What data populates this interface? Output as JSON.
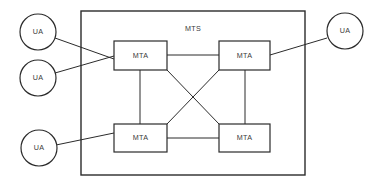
{
  "diagram": {
    "stroke_color": "#2b2b2b",
    "text_color": "#3a3a3a",
    "background_color": "#ffffff",
    "boundary": {
      "label": "MTS",
      "label_x": 193,
      "label_y": 29,
      "x": 81,
      "y": 11,
      "width": 224,
      "height": 164
    },
    "nodes": [
      {
        "id": "ua-left-top",
        "label": "UA",
        "shape": "circle",
        "cx": 38,
        "cy": 32,
        "r": 18
      },
      {
        "id": "ua-left-middle",
        "label": "UA",
        "shape": "circle",
        "cx": 38,
        "cy": 78,
        "r": 18
      },
      {
        "id": "ua-left-bottom",
        "label": "UA",
        "shape": "circle",
        "cx": 39,
        "cy": 148,
        "r": 18
      },
      {
        "id": "ua-right-top",
        "label": "UA",
        "shape": "circle",
        "cx": 345,
        "cy": 31,
        "r": 18
      },
      {
        "id": "mta-top-left",
        "label": "MTA",
        "shape": "rect",
        "x": 114,
        "y": 41,
        "width": 53,
        "height": 29
      },
      {
        "id": "mta-top-right",
        "label": "MTA",
        "shape": "rect",
        "x": 219,
        "y": 41,
        "width": 51,
        "height": 29
      },
      {
        "id": "mta-bottom-left",
        "label": "MTA",
        "shape": "rect",
        "x": 114,
        "y": 124,
        "width": 53,
        "height": 28
      },
      {
        "id": "mta-bottom-right",
        "label": "MTA",
        "shape": "rect",
        "x": 219,
        "y": 124,
        "width": 51,
        "height": 28
      }
    ],
    "edges": [
      {
        "id": "edge-ua-left-top-to-mta-top-left",
        "from": "ua-left-top",
        "to": "mta-top-left",
        "x1": 55,
        "y1": 38,
        "x2": 114,
        "y2": 59
      },
      {
        "id": "edge-ua-left-middle-to-mta-top-left",
        "from": "ua-left-middle",
        "to": "mta-top-left",
        "x1": 55,
        "y1": 73,
        "x2": 114,
        "y2": 56
      },
      {
        "id": "edge-ua-left-bottom-to-mta-bottom-left",
        "from": "ua-left-bottom",
        "to": "mta-bottom-left",
        "x1": 56,
        "y1": 145,
        "x2": 114,
        "y2": 133
      },
      {
        "id": "edge-ua-right-top-to-mta-top-right",
        "from": "ua-right-top",
        "to": "mta-top-right",
        "x1": 327,
        "y1": 38,
        "x2": 270,
        "y2": 55
      },
      {
        "id": "edge-mta-top-left-to-mta-top-right",
        "from": "mta-top-left",
        "to": "mta-top-right",
        "x1": 167,
        "y1": 55,
        "x2": 219,
        "y2": 55
      },
      {
        "id": "edge-mta-top-left-to-mta-bottom-left",
        "from": "mta-top-left",
        "to": "mta-bottom-left",
        "x1": 140,
        "y1": 70,
        "x2": 140,
        "y2": 124
      },
      {
        "id": "edge-mta-top-right-to-mta-bottom-right",
        "from": "mta-top-right",
        "to": "mta-bottom-right",
        "x1": 245,
        "y1": 70,
        "x2": 245,
        "y2": 124
      },
      {
        "id": "edge-mta-bottom-left-to-mta-bottom-right",
        "from": "mta-bottom-left",
        "to": "mta-bottom-right",
        "x1": 167,
        "y1": 138,
        "x2": 219,
        "y2": 138
      },
      {
        "id": "edge-mta-top-left-to-mta-bottom-right",
        "from": "mta-top-left",
        "to": "mta-bottom-right",
        "x1": 167,
        "y1": 70,
        "x2": 219,
        "y2": 124
      },
      {
        "id": "edge-mta-top-right-to-mta-bottom-left",
        "from": "mta-top-right",
        "to": "mta-bottom-left",
        "x1": 219,
        "y1": 70,
        "x2": 167,
        "y2": 124
      }
    ]
  }
}
